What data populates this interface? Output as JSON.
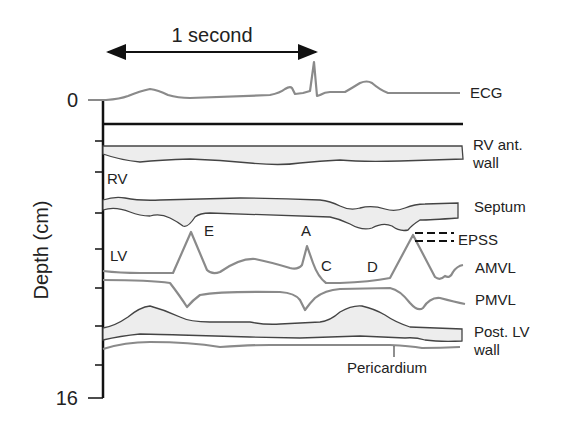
{
  "time_scale": {
    "label": "1 second"
  },
  "axis": {
    "label": "Depth (cm)",
    "tick_top": "0",
    "tick_bottom": "16",
    "range": [
      0,
      16
    ]
  },
  "region_labels": {
    "rv": "RV",
    "lv": "LV"
  },
  "wave_labels": {
    "e": "E",
    "a": "A",
    "c": "C",
    "d": "D"
  },
  "trace_labels": {
    "ecg": "ECG",
    "rv_ant_wall_1": "RV ant.",
    "rv_ant_wall_2": "wall",
    "septum": "Septum",
    "epss": "EPSS",
    "amvl": "AMVL",
    "pmvl": "PMVL",
    "post_lv_wall_1": "Post. LV",
    "post_lv_wall_2": "wall",
    "pericardium": "Pericardium"
  },
  "colors": {
    "trace_gray": "#8a8a8a",
    "wall_fill": "#ededed",
    "wall_outline": "#444444",
    "axis": "#111111",
    "text": "#222222"
  }
}
